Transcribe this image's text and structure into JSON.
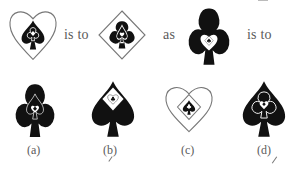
{
  "question": {
    "connector_1": "is to",
    "connector_2": "as",
    "connector_3": "is to",
    "figures": [
      {
        "id": "q1",
        "outer": "heart-outline",
        "middle": "spade-solid",
        "inner": "club-outline",
        "core": "diamond-solid"
      },
      {
        "id": "q2",
        "outer": "diamond-outline",
        "middle": "club-solid",
        "inner": "spade-outline",
        "core": "heart-solid"
      },
      {
        "id": "q3",
        "outer": "club-solid",
        "middle": "heart-outline",
        "inner": "diamond-outline",
        "core": "spade-solid"
      }
    ]
  },
  "options": [
    {
      "label": "(a)",
      "outer": "club-solid",
      "middle": "spade-outline",
      "inner": "heart-outline",
      "core": "diamond-solid"
    },
    {
      "label": "(b)",
      "outer": "spade-solid",
      "middle": "diamond-outline",
      "inner": "heart-outline",
      "core": "club-solid"
    },
    {
      "label": "(c)",
      "outer": "heart-outline",
      "middle": "diamond-outline",
      "inner": "spade-solid",
      "core": "club-outline"
    },
    {
      "label": "(d)",
      "outer": "spade-solid",
      "middle": "club-outline",
      "inner": "heart-outline",
      "core": "diamond-solid"
    }
  ],
  "colors": {
    "ink": "#111111",
    "outline": "#777777",
    "text": "#5a5a5a",
    "paper": "#ffffff"
  }
}
